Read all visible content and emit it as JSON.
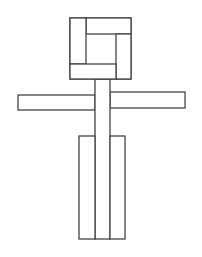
{
  "figure": {
    "stroke_color": "#444444",
    "background": "#ffffff",
    "parts": {
      "head_outer": {
        "x": 70,
        "y": 18,
        "w": 61,
        "h": 61
      },
      "head_top_bar": {
        "x": 86,
        "y": 18,
        "w": 45,
        "h": 16
      },
      "head_left_bar": {
        "x": 70,
        "y": 18,
        "w": 16,
        "h": 46
      },
      "head_right_bar": {
        "x": 116,
        "y": 34,
        "w": 15,
        "h": 45
      },
      "head_bottom_bar": {
        "x": 70,
        "y": 64,
        "w": 46,
        "h": 15
      },
      "head_center": {
        "x": 86,
        "y": 34,
        "w": 30,
        "h": 30
      },
      "neck_body": {
        "x": 95,
        "y": 79,
        "w": 15,
        "h": 160
      },
      "left_arm": {
        "x": 18,
        "y": 95,
        "w": 77,
        "h": 15
      },
      "right_arm": {
        "x": 110,
        "y": 92,
        "w": 75,
        "h": 16
      },
      "left_leg": {
        "x": 79,
        "y": 136,
        "w": 16,
        "h": 103
      },
      "right_leg": {
        "x": 110,
        "y": 136,
        "w": 15,
        "h": 103
      }
    }
  }
}
